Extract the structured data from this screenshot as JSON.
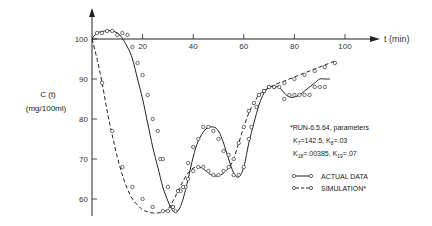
{
  "chart_data": {
    "type": "line",
    "title": "",
    "xlabel": "t (min)",
    "ylabel": "C (t)",
    "ylabel_units": "(mg/100ml)",
    "xlim": [
      0,
      110
    ],
    "ylim": [
      55,
      103
    ],
    "x_ticks": [
      20,
      40,
      60,
      80,
      100
    ],
    "x_tick_labels": [
      "20",
      "40",
      "60",
      "80",
      "100"
    ],
    "y_ticks": [
      100,
      90,
      80,
      70,
      60
    ],
    "y_tick_labels": [
      "100",
      "90",
      "80",
      "70",
      "60"
    ],
    "grid": false,
    "legend_position": "right",
    "series": [
      {
        "name": "ACTUAL DATA",
        "style": "solid",
        "marker": "open-circle",
        "x": [
          0,
          2,
          5,
          8,
          11,
          14,
          16,
          18,
          20,
          22,
          24,
          26,
          28,
          30,
          32,
          34,
          36,
          38,
          40,
          42,
          45,
          48,
          50,
          52,
          54,
          56,
          58,
          60,
          62,
          64,
          66,
          68,
          70,
          72,
          74,
          76,
          78,
          80,
          82,
          84,
          86,
          88,
          90,
          92,
          94
        ],
        "values": [
          100,
          101.5,
          102,
          102,
          101,
          98,
          95,
          90,
          85,
          79,
          73,
          68,
          63,
          59.5,
          57,
          57,
          60,
          65,
          70.5,
          74.5,
          77.5,
          78,
          77,
          74,
          70,
          66.5,
          65.5,
          68,
          74,
          79,
          83.5,
          86.5,
          88,
          88,
          88,
          86.5,
          85.5,
          85.5,
          86,
          87,
          88,
          89,
          90,
          90,
          90
        ],
        "points_x": [
          2,
          4,
          6,
          8,
          10,
          12,
          14,
          16,
          18,
          20,
          22,
          24,
          26,
          27,
          28,
          30,
          32,
          33,
          35,
          37,
          38,
          40,
          42,
          44,
          46,
          48,
          50,
          52,
          54,
          56,
          58,
          60,
          62,
          63,
          65,
          68,
          70,
          72,
          74,
          76,
          78,
          80,
          82,
          84,
          86,
          88,
          90,
          92
        ],
        "points_y": [
          101.5,
          101.5,
          102,
          102,
          101,
          101.5,
          101,
          98,
          94,
          91,
          86,
          80,
          77,
          70,
          70,
          63,
          58,
          57,
          62,
          63,
          69,
          73,
          75,
          78,
          78,
          77,
          75,
          72,
          71,
          66,
          66,
          68,
          75,
          78,
          83,
          87,
          88,
          88,
          88,
          85,
          86,
          86,
          86,
          86,
          86,
          88,
          88,
          88
        ]
      },
      {
        "name": "SIMULATION*",
        "style": "dashed",
        "marker": "open-circle",
        "x": [
          0,
          2,
          4,
          6,
          8,
          10,
          12,
          14,
          16,
          18,
          20,
          22,
          24,
          26,
          28,
          30,
          32,
          34,
          36,
          38,
          40,
          42,
          44,
          46,
          48,
          50,
          52,
          54,
          56,
          58,
          60,
          62,
          64,
          66,
          68,
          70,
          72,
          76,
          80,
          84,
          88,
          92,
          96
        ],
        "values": [
          100,
          95,
          89,
          82,
          76,
          70.5,
          66,
          62.5,
          60,
          58.5,
          57.3,
          56.8,
          56.5,
          56.5,
          56.8,
          57.5,
          59.5,
          62,
          64.5,
          66.5,
          67.7,
          68,
          67.5,
          66.5,
          65.8,
          65.8,
          66.5,
          67.8,
          70,
          74,
          78,
          81.5,
          84,
          86,
          87,
          87.8,
          88.5,
          89.5,
          90.5,
          91.5,
          92.5,
          93.5,
          94.5
        ],
        "points_x": [
          4,
          8,
          12,
          16,
          20,
          24,
          28,
          30,
          32,
          34,
          36,
          38,
          40,
          42,
          44,
          46,
          48,
          50,
          52,
          54,
          56,
          58,
          60,
          62,
          64,
          66,
          68,
          70,
          72,
          76,
          80,
          84,
          88,
          92,
          96
        ],
        "points_y": [
          89,
          77,
          68,
          63,
          60,
          58,
          57,
          57,
          58,
          62,
          63,
          65,
          67,
          68,
          68,
          67,
          66,
          66,
          67,
          68,
          70,
          74,
          78,
          82,
          84,
          86,
          87,
          88,
          88,
          89,
          90,
          91,
          92,
          93,
          94
        ]
      }
    ],
    "annotations": [
      "*RUN-6.5.64, parameters",
      "K7=142.5, K8=.03",
      "K18=.00385, K19=.07"
    ]
  },
  "axes": {
    "x_label": "t (min)",
    "y_label_line1": "C (t)",
    "y_label_line2": "(mg/100ml)",
    "x_ticks": [
      "20",
      "40",
      "60",
      "80",
      "100"
    ],
    "y_ticks": [
      "100",
      "90",
      "80",
      "70",
      "60"
    ]
  },
  "annotation": {
    "line1": "*RUN-6.5.64, parameters",
    "line2_k7": "K",
    "line2_k7_sub": "7",
    "line2_k7_val": "=142.5, K",
    "line2_k8_sub": "8",
    "line2_k8_val": "=.03",
    "line3_k18": "K",
    "line3_k18_sub": "18",
    "line3_k18_val": "=.00385, K",
    "line3_k19_sub": "19",
    "line3_k19_val": "=.07"
  },
  "legend": {
    "actual": "ACTUAL DATA",
    "simulation": "SIMULATION*"
  }
}
